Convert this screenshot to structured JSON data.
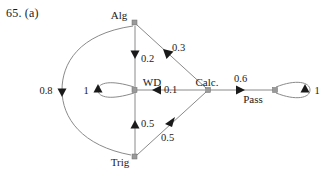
{
  "figure": {
    "label": "65. (a)",
    "type": "weighted-directed-graph"
  },
  "graph": {
    "nodes": [
      {
        "id": "alg",
        "label": "Alg",
        "x": 135,
        "y": 23,
        "label_x": 119,
        "label_y": 19
      },
      {
        "id": "wd",
        "label": "WD",
        "x": 135,
        "y": 90,
        "label_x": 142,
        "label_y": 86
      },
      {
        "id": "trig",
        "label": "Trig",
        "x": 135,
        "y": 157,
        "label_x": 112,
        "label_y": 163
      },
      {
        "id": "calc",
        "label": "Calc.",
        "x": 208,
        "y": 90,
        "label_x": 196,
        "label_y": 86
      },
      {
        "id": "pass",
        "label": "Pass",
        "x": 275,
        "y": 90,
        "label_x": 240,
        "label_y": 103
      }
    ],
    "edges": [
      {
        "id": "alg-wd",
        "from": "Alg",
        "to": "WD",
        "weight": "0.2",
        "weight_x": 140,
        "weight_y": 61
      },
      {
        "id": "calc-alg",
        "from": "Calc",
        "to": "Alg",
        "weight": "0.3",
        "weight_x": 172,
        "weight_y": 50
      },
      {
        "id": "calc-wd",
        "from": "Calc",
        "to": "WD",
        "weight": "0.1",
        "weight_x": 166,
        "weight_y": 87
      },
      {
        "id": "trig-wd",
        "from": "Trig",
        "to": "WD",
        "weight": "0.5",
        "weight_x": 141,
        "weight_y": 125
      },
      {
        "id": "calc-trig",
        "from": "Calc",
        "to": "Trig",
        "weight": "0.5",
        "weight_x": 164,
        "weight_y": 138
      },
      {
        "id": "alg-trig",
        "from": "Alg",
        "to": "Trig",
        "weight": "0.8",
        "weight_x": 46,
        "weight_y": 94
      },
      {
        "id": "calc-pass",
        "from": "Calc",
        "to": "Pass",
        "weight": "0.6",
        "weight_x": 233,
        "weight_y": 80
      }
    ],
    "self_loops": [
      {
        "id": "wd-loop",
        "node": "WD",
        "weight": "1",
        "weight_x": 86,
        "weight_y": 94,
        "side": "left"
      },
      {
        "id": "pass-loop",
        "node": "Pass",
        "weight": "1",
        "weight_x": 315,
        "weight_y": 94,
        "side": "right"
      }
    ],
    "colors": {
      "edge": "#8a8a8a",
      "arrow": "#1a1a1a",
      "node": "#9a9a9a",
      "text": "#1a1a1a",
      "background": "#ffffff"
    }
  }
}
